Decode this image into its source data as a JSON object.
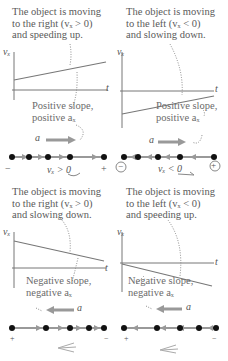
{
  "panels": [
    {
      "id": "right-speeding-up",
      "caption": [
        "The object is moving",
        "to the right (vₓ > 0)",
        "and speeding up."
      ],
      "slope_text": [
        "Positive slope,",
        "positive aₓ"
      ],
      "velocity_label": "vₓ > 0",
      "accel_label": "a⃗",
      "accel_direction": "right",
      "motion_direction": "right",
      "sign_left": "−",
      "sign_right": "+"
    },
    {
      "id": "left-slowing-down",
      "caption": [
        "The object is moving",
        "to the left (vₓ < 0)",
        "and slowing down."
      ],
      "slope_text": [
        "Positive slope,",
        "positive aₓ"
      ],
      "velocity_label": "vₓ < 0",
      "accel_label": "a⃗",
      "accel_direction": "right",
      "motion_direction": "left",
      "sign_left": "−",
      "sign_right": "+"
    },
    {
      "id": "right-slowing-down",
      "caption": [
        "The object is moving",
        "to the right (vₓ > 0)",
        "and slowing down."
      ],
      "slope_text": [
        "Negative slope,",
        "negative aₓ"
      ],
      "accel_label": "a⃗",
      "accel_direction": "left",
      "motion_direction": "right",
      "sign_left": "+",
      "sign_right": "−"
    },
    {
      "id": "left-speeding-up",
      "caption": [
        "The object is moving",
        "to the left (vₓ < 0)",
        "and speeding up."
      ],
      "slope_text": [
        "Negative slope,",
        "negative aₓ"
      ],
      "accel_label": "a⃗",
      "accel_direction": "left",
      "motion_direction": "left",
      "sign_left": "+",
      "sign_right": "−"
    }
  ],
  "axes": {
    "y_label": "vₓ",
    "x_label": "t"
  },
  "colors": {
    "line": "#777777",
    "arrow": "#999999",
    "dot": "#111111",
    "text": "#5a5a5a"
  }
}
